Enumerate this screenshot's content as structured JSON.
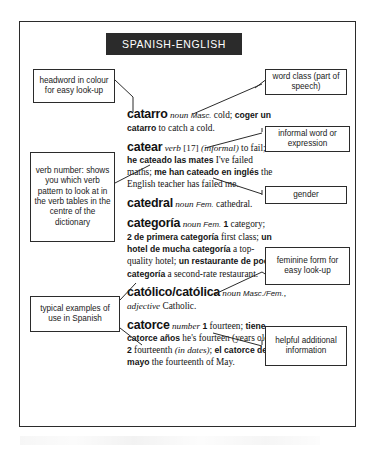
{
  "page": {
    "header_title": "SPANISH-ENGLISH"
  },
  "entries": [
    {
      "headword": "catarro",
      "pos": "noun",
      "gender": "Masc.",
      "sense": " cold; ",
      "example_es": "coger un catarro",
      "example_en": " to catch a cold."
    },
    {
      "headword": "catear",
      "pos": "verb",
      "verb_number": "[17]",
      "register": "(informal)",
      "sense": " to fail; ",
      "example1_es": "he cateado las mates",
      "example1_en": " I've failed maths; ",
      "example2_es": "me han cateado en inglés",
      "example2_en": " the English teacher has failed me."
    },
    {
      "headword": "catedral",
      "pos": "noun",
      "gender": "Fem.",
      "sense": " cathedral."
    },
    {
      "headword": "categoría",
      "pos": "noun",
      "gender": "Fem.",
      "sense1_num": "1",
      "sense1": " category; ",
      "sense2_num": "2",
      "example1_es": "de primera categoría",
      "example1_en": " first class; ",
      "example2_es": "un hotel de mucha categoría",
      "example2_en": " a top-quality hotel; ",
      "example3_es": "un restaurante de poca categoría",
      "example3_en": " a second-rate restaurant."
    },
    {
      "headword": "católico/católica",
      "pos": "noun",
      "gender": "Masc./Fem.",
      "pos2": ", adjective",
      "sense": " Catholic."
    },
    {
      "headword": "catorce",
      "pos": "number",
      "sense1_num": "1",
      "sense1": " fourteen; ",
      "example1_es": "tiene catorce años",
      "example1_en": " he's fourteen (years old); ",
      "sense2_num": "2",
      "sense2": " fourteenth ",
      "sense2_note": "(in dates)",
      "sense2_tail": "; ",
      "example2_es": "el catorce de mayo",
      "example2_en": " the fourteenth of May."
    }
  ],
  "callouts": {
    "headword_colour": "headword in colour for easy look-up",
    "verb_number": "verb number: shows you which verb pattern to look at in the verb tables in the centre of the dictionary",
    "typical_examples": "typical examples of use in Spanish",
    "word_class": "word class (part of speech)",
    "informal": "informal word or expression",
    "gender": "gender",
    "feminine_form": "feminine form for easy look-up",
    "helpful_info": "helpful additional information"
  },
  "colors": {
    "banner_bg": "#2b2b2b",
    "banner_text": "#ffffff",
    "frame": "#2b2b2b",
    "callout_border": "#2b2b2b",
    "body_text": "#141414"
  }
}
